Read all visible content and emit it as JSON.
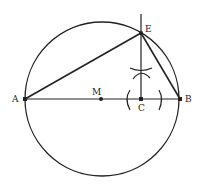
{
  "diagram": {
    "type": "geometric-construction",
    "stroke_color": "#222222",
    "background": "#ffffff",
    "circle": {
      "cx": 102,
      "cy": 99,
      "r": 77
    },
    "points": {
      "A": {
        "label": "A",
        "x": 25,
        "y": 99
      },
      "B": {
        "label": "B",
        "x": 180,
        "y": 99
      },
      "M": {
        "label": "M",
        "x": 101,
        "y": 99
      },
      "C": {
        "label": "C",
        "x": 141,
        "y": 99
      },
      "E": {
        "label": "E",
        "x": 141,
        "y": 33
      }
    },
    "labels": {
      "A": "A",
      "B": "B",
      "M": "M",
      "C": "C",
      "E": "E"
    }
  }
}
